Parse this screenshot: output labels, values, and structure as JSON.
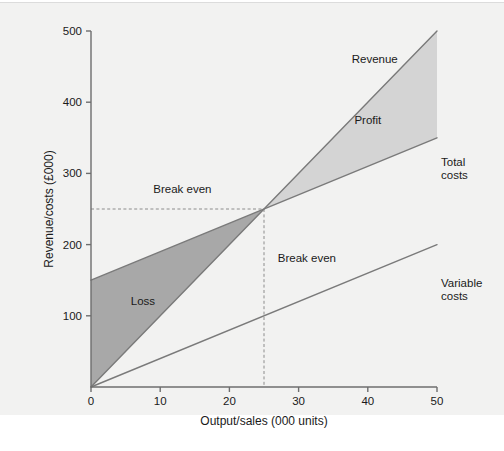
{
  "chart_data": {
    "type": "line",
    "title": "",
    "xlabel": "Output/sales (000 units)",
    "ylabel": "Revenue/costs (£000)",
    "xlim": [
      0,
      50
    ],
    "ylim": [
      0,
      500
    ],
    "xticks": [
      "0",
      "10",
      "20",
      "30",
      "40",
      "50"
    ],
    "xtick_values": [
      0,
      10,
      20,
      30,
      40,
      50
    ],
    "yticks": [
      "100",
      "200",
      "300",
      "400",
      "500"
    ],
    "ytick_values": [
      100,
      200,
      300,
      400,
      500
    ],
    "grid": false,
    "legend": "inline-labels",
    "series": [
      {
        "name": "Revenue",
        "x": [
          0,
          50
        ],
        "values": [
          0,
          500
        ],
        "label_x": 41,
        "label_y": 455
      },
      {
        "name": "Total costs",
        "x": [
          0,
          50
        ],
        "values": [
          150,
          350
        ],
        "label_x": 50.5,
        "label_y": 310
      },
      {
        "name": "Variable costs",
        "x": [
          0,
          50
        ],
        "values": [
          0,
          200
        ],
        "label_x": 50.5,
        "label_y": 140
      }
    ],
    "regions": [
      {
        "name": "Loss",
        "label": "Loss",
        "between": [
          "Total costs",
          "Revenue"
        ],
        "x_range": [
          0,
          25
        ],
        "fill": "#a8a8a8",
        "label_x": 7.5,
        "label_y": 115
      },
      {
        "name": "Profit",
        "label": "Profit",
        "between": [
          "Total costs",
          "Revenue"
        ],
        "x_range": [
          25,
          50
        ],
        "fill": "#d4d4d4",
        "label_x": 40,
        "label_y": 370
      }
    ],
    "annotations": [
      {
        "name": "break-even-horizontal",
        "label": "Break even",
        "axis": "y",
        "value": 250,
        "style": "dashed",
        "label_x": 9,
        "label_y": 272
      },
      {
        "name": "break-even-vertical",
        "label": "Break even",
        "axis": "x",
        "value": 25,
        "style": "dashed",
        "label_x": 27,
        "label_y": 175
      }
    ],
    "break_even_point": {
      "x": 25,
      "y": 250
    },
    "colors": {
      "background": "#f2f2f1",
      "axis": "#6e6e6e",
      "line": "#7a7a7a",
      "loss_fill": "#a8a8a8",
      "profit_fill": "#d4d4d4",
      "text": "#1a1a1a",
      "dash": "#8c8c8c"
    }
  },
  "figure": {
    "caption_fragment": ""
  }
}
